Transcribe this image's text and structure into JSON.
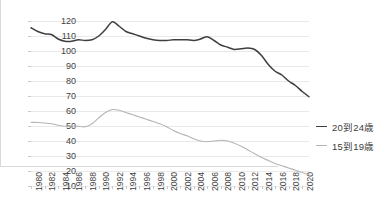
{
  "chart_data": {
    "type": "line",
    "title": "",
    "xlabel": "",
    "ylabel": "",
    "xlim": [
      1980,
      2021
    ],
    "ylim": [
      10,
      120
    ],
    "ytick_step": 10,
    "grid": true,
    "legend_position": "right",
    "yticks": [
      120,
      110,
      100,
      90,
      80,
      70,
      60,
      50,
      40,
      30,
      20,
      10
    ],
    "xticks": [
      "1980",
      "1982",
      "1984",
      "1986",
      "1988",
      "1990",
      "1992",
      "1994",
      "1996",
      "1998",
      "2000",
      "2002",
      "2004",
      "2006",
      "2008",
      "2010",
      "2012",
      "2014",
      "2016",
      "2018",
      "2020"
    ],
    "x": [
      1980,
      1981,
      1982,
      1983,
      1984,
      1985,
      1986,
      1987,
      1988,
      1989,
      1990,
      1991,
      1992,
      1993,
      1994,
      1995,
      1996,
      1997,
      1998,
      1999,
      2000,
      2001,
      2002,
      2003,
      2004,
      2005,
      2006,
      2007,
      2008,
      2009,
      2010,
      2011,
      2012,
      2013,
      2014,
      2015,
      2016,
      2017,
      2018,
      2019,
      2020,
      2021
    ],
    "series": [
      {
        "name": "20到24歳",
        "color": "#3f3f3f",
        "values": [
          115.5,
          113.0,
          111.5,
          111.0,
          108.0,
          106.5,
          106.5,
          107.5,
          107.0,
          107.5,
          110.0,
          114.5,
          119.5,
          116.5,
          113.0,
          111.5,
          110.0,
          108.5,
          107.5,
          107.0,
          107.0,
          107.5,
          107.5,
          107.5,
          107.0,
          108.0,
          109.5,
          107.0,
          104.0,
          102.5,
          101.0,
          101.5,
          102.0,
          101.0,
          97.0,
          91.0,
          86.5,
          84.0,
          80.0,
          77.0,
          73.0,
          69.5
        ]
      },
      {
        "name": "15到19歳",
        "color": "#b5b5b5",
        "values": [
          52.5,
          52.3,
          52.0,
          51.5,
          50.5,
          49.8,
          50.0,
          49.8,
          49.5,
          51.5,
          55.5,
          59.0,
          61.0,
          60.5,
          59.0,
          57.5,
          56.0,
          54.5,
          53.0,
          51.5,
          49.5,
          47.0,
          45.0,
          43.5,
          41.5,
          40.0,
          39.5,
          40.0,
          40.5,
          40.0,
          38.5,
          36.5,
          34.0,
          31.5,
          29.0,
          27.0,
          25.0,
          23.5,
          22.0,
          20.5,
          19.0,
          17.5
        ]
      }
    ]
  },
  "legend": {
    "items": [
      {
        "label": "20到24歳"
      },
      {
        "label": "15到19歳"
      }
    ]
  }
}
